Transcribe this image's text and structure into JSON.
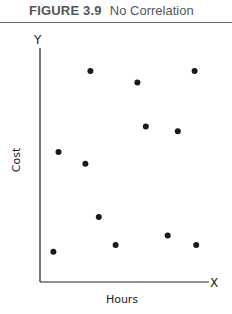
{
  "header": {
    "figure_label": "FIGURE 3.9",
    "figure_title": "No Correlation"
  },
  "axes": {
    "x_letter": "X",
    "y_letter": "Y",
    "x_label": "Hours",
    "y_label": "Cost"
  },
  "colors": {
    "dot": "#1a1a1a",
    "axis": "#222222",
    "title": "#555555"
  },
  "chart_data": {
    "type": "scatter",
    "xlabel": "Hours",
    "ylabel": "Cost",
    "xlim": [
      0,
      10
    ],
    "ylim": [
      0,
      10
    ],
    "grid": false,
    "legend": null,
    "ticks": "none",
    "points": [
      {
        "x": 3.0,
        "y": 9.1
      },
      {
        "x": 5.8,
        "y": 8.6
      },
      {
        "x": 9.2,
        "y": 9.1
      },
      {
        "x": 1.1,
        "y": 5.6
      },
      {
        "x": 2.7,
        "y": 5.1
      },
      {
        "x": 6.3,
        "y": 6.7
      },
      {
        "x": 8.2,
        "y": 6.5
      },
      {
        "x": 0.8,
        "y": 1.3
      },
      {
        "x": 3.5,
        "y": 2.8
      },
      {
        "x": 4.5,
        "y": 1.6
      },
      {
        "x": 7.6,
        "y": 2.0
      },
      {
        "x": 9.3,
        "y": 1.6
      }
    ]
  }
}
